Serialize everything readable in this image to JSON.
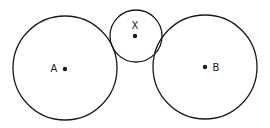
{
  "diagram": {
    "stroke_color": "#1a1a1a",
    "background": "#ffffff",
    "circles": [
      {
        "id": "A",
        "label": "A",
        "cx": 65,
        "cy": 68,
        "r": 52,
        "label_x": 54,
        "label_y": 72
      },
      {
        "id": "X",
        "label": "X",
        "cx": 136,
        "cy": 36,
        "r": 26,
        "label_x": 135,
        "label_y": 29
      },
      {
        "id": "B",
        "label": "B",
        "cx": 205,
        "cy": 67,
        "r": 52,
        "label_x": 216,
        "label_y": 71
      }
    ],
    "center_points": [
      {
        "of": "A",
        "x": 65,
        "y": 69
      },
      {
        "of": "X",
        "x": 135,
        "y": 36
      },
      {
        "of": "B",
        "x": 205,
        "y": 67
      }
    ]
  }
}
